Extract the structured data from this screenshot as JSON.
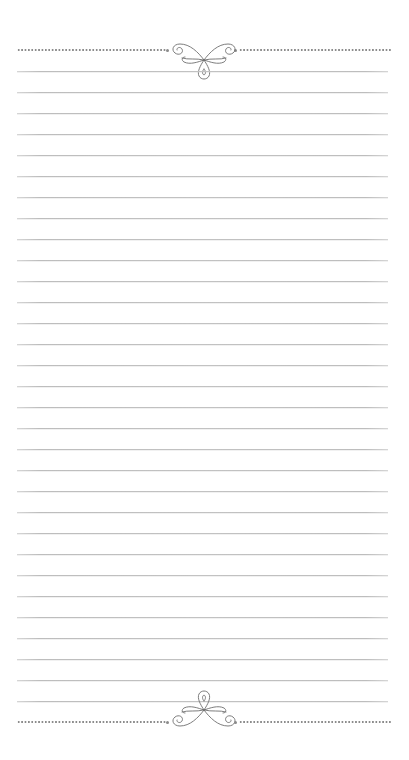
{
  "page": {
    "type": "lined-notepaper",
    "background_color": "#ffffff",
    "rule_color": "#bdbdbd",
    "dot_color": "#8c8c8c",
    "ornament_color": "#6e6e6e"
  },
  "header": {
    "ornament": "flourish-scroll-icon",
    "divider": "dotted-line"
  },
  "body": {
    "ruled_line_count": 31,
    "first_line_y": 71,
    "line_spacing": 21
  },
  "footer": {
    "ornament": "flourish-scroll-icon-inverted",
    "divider": "dotted-line"
  }
}
